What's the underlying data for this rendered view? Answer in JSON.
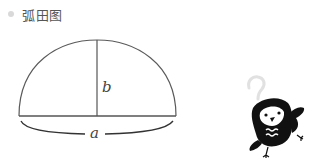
{
  "header": {
    "title": "弧田图",
    "bullet_color": "#d9d9d9"
  },
  "diagram": {
    "shape": "arc-field (circular segment)",
    "labels": {
      "chord": "a",
      "height": "b"
    }
  },
  "illustration": {
    "character": "black bird mascot",
    "symbol": "?"
  }
}
